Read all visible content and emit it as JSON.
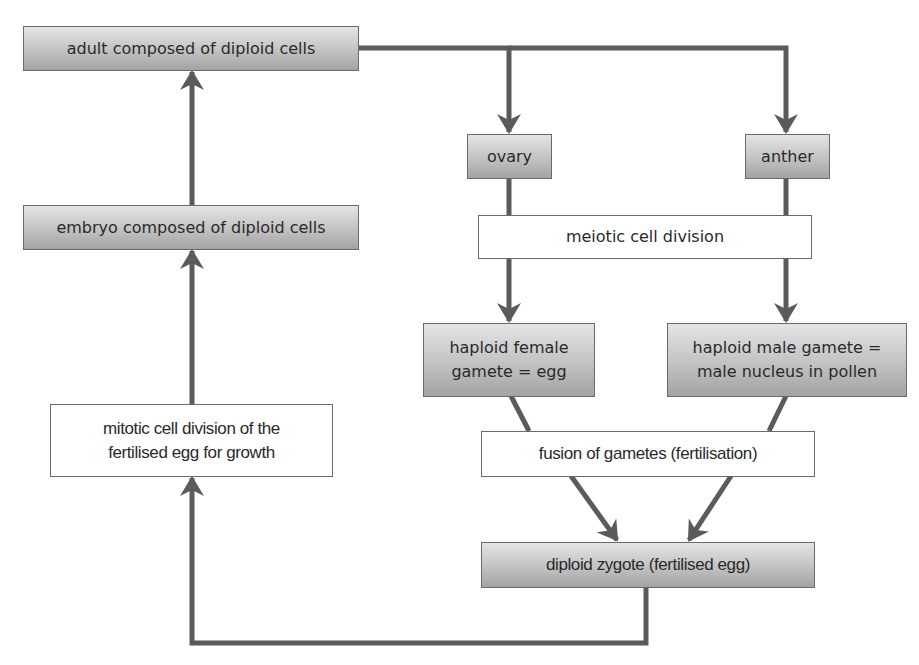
{
  "diagram": {
    "type": "flowchart",
    "colors": {
      "arrow": "#5b5b5b",
      "shaded_box_top": "#e4e4e4",
      "shaded_box_bottom": "#a3a3a3",
      "plain_box": "#ffffff",
      "border": "#6a6a6a",
      "text": "#2a2a2a"
    },
    "nodes": {
      "adult": {
        "label": "adult composed of diploid cells",
        "style": "shaded"
      },
      "embryo": {
        "label": "embryo composed of diploid cells",
        "style": "shaded"
      },
      "ovary": {
        "label": "ovary",
        "style": "shaded"
      },
      "anther": {
        "label": "anther",
        "style": "shaded"
      },
      "meiosis": {
        "label": "meiotic cell division",
        "style": "plain"
      },
      "female_gamete": {
        "line1": "haploid female",
        "line2": "gamete = egg",
        "style": "shaded"
      },
      "male_gamete": {
        "line1": "haploid male gamete =",
        "line2": "male nucleus in pollen",
        "style": "shaded"
      },
      "mitosis": {
        "line1": "mitotic cell division of the",
        "line2": "fertilised egg for growth",
        "style": "plain"
      },
      "fusion": {
        "label": "fusion of gametes (fertilisation)",
        "style": "plain"
      },
      "zygote": {
        "label": "diploid zygote (fertilised egg)",
        "style": "shaded"
      }
    },
    "edges": [
      {
        "from": "adult",
        "to": "ovary"
      },
      {
        "from": "adult",
        "to": "anther"
      },
      {
        "from": "ovary",
        "to": "female_gamete",
        "via": "meiosis"
      },
      {
        "from": "anther",
        "to": "male_gamete",
        "via": "meiosis"
      },
      {
        "from": "female_gamete",
        "to": "zygote",
        "via": "fusion"
      },
      {
        "from": "male_gamete",
        "to": "zygote",
        "via": "fusion"
      },
      {
        "from": "zygote",
        "to": "mitosis"
      },
      {
        "from": "mitosis",
        "to": "embryo"
      },
      {
        "from": "embryo",
        "to": "adult"
      }
    ]
  }
}
